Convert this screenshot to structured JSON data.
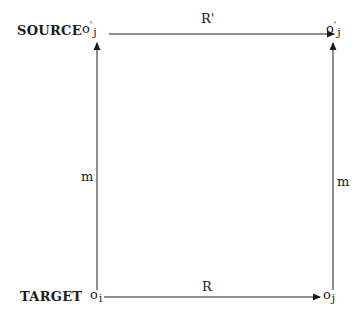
{
  "diagram": {
    "rows": {
      "source": {
        "label": "SOURCE"
      },
      "target": {
        "label": "TARGET"
      }
    },
    "nodes": {
      "source_left": {
        "base": "o",
        "prime": "'",
        "subscript": "j"
      },
      "source_right": {
        "base": "o",
        "prime": "'",
        "subscript": "j"
      },
      "target_left": {
        "base": "o",
        "prime": "",
        "subscript": "i"
      },
      "target_right": {
        "base": "o",
        "prime": "",
        "subscript": "j"
      }
    },
    "edges": {
      "top": {
        "label": "R'",
        "from": "source_left",
        "to": "source_right"
      },
      "bottom": {
        "label": "R",
        "from": "target_left",
        "to": "target_right"
      },
      "left": {
        "label": "m",
        "from": "target_left",
        "to": "source_left"
      },
      "right": {
        "label": "m",
        "from": "target_right",
        "to": "source_right"
      }
    },
    "colors": {
      "line": "#1a1a1a",
      "background": "#ffffff"
    }
  }
}
